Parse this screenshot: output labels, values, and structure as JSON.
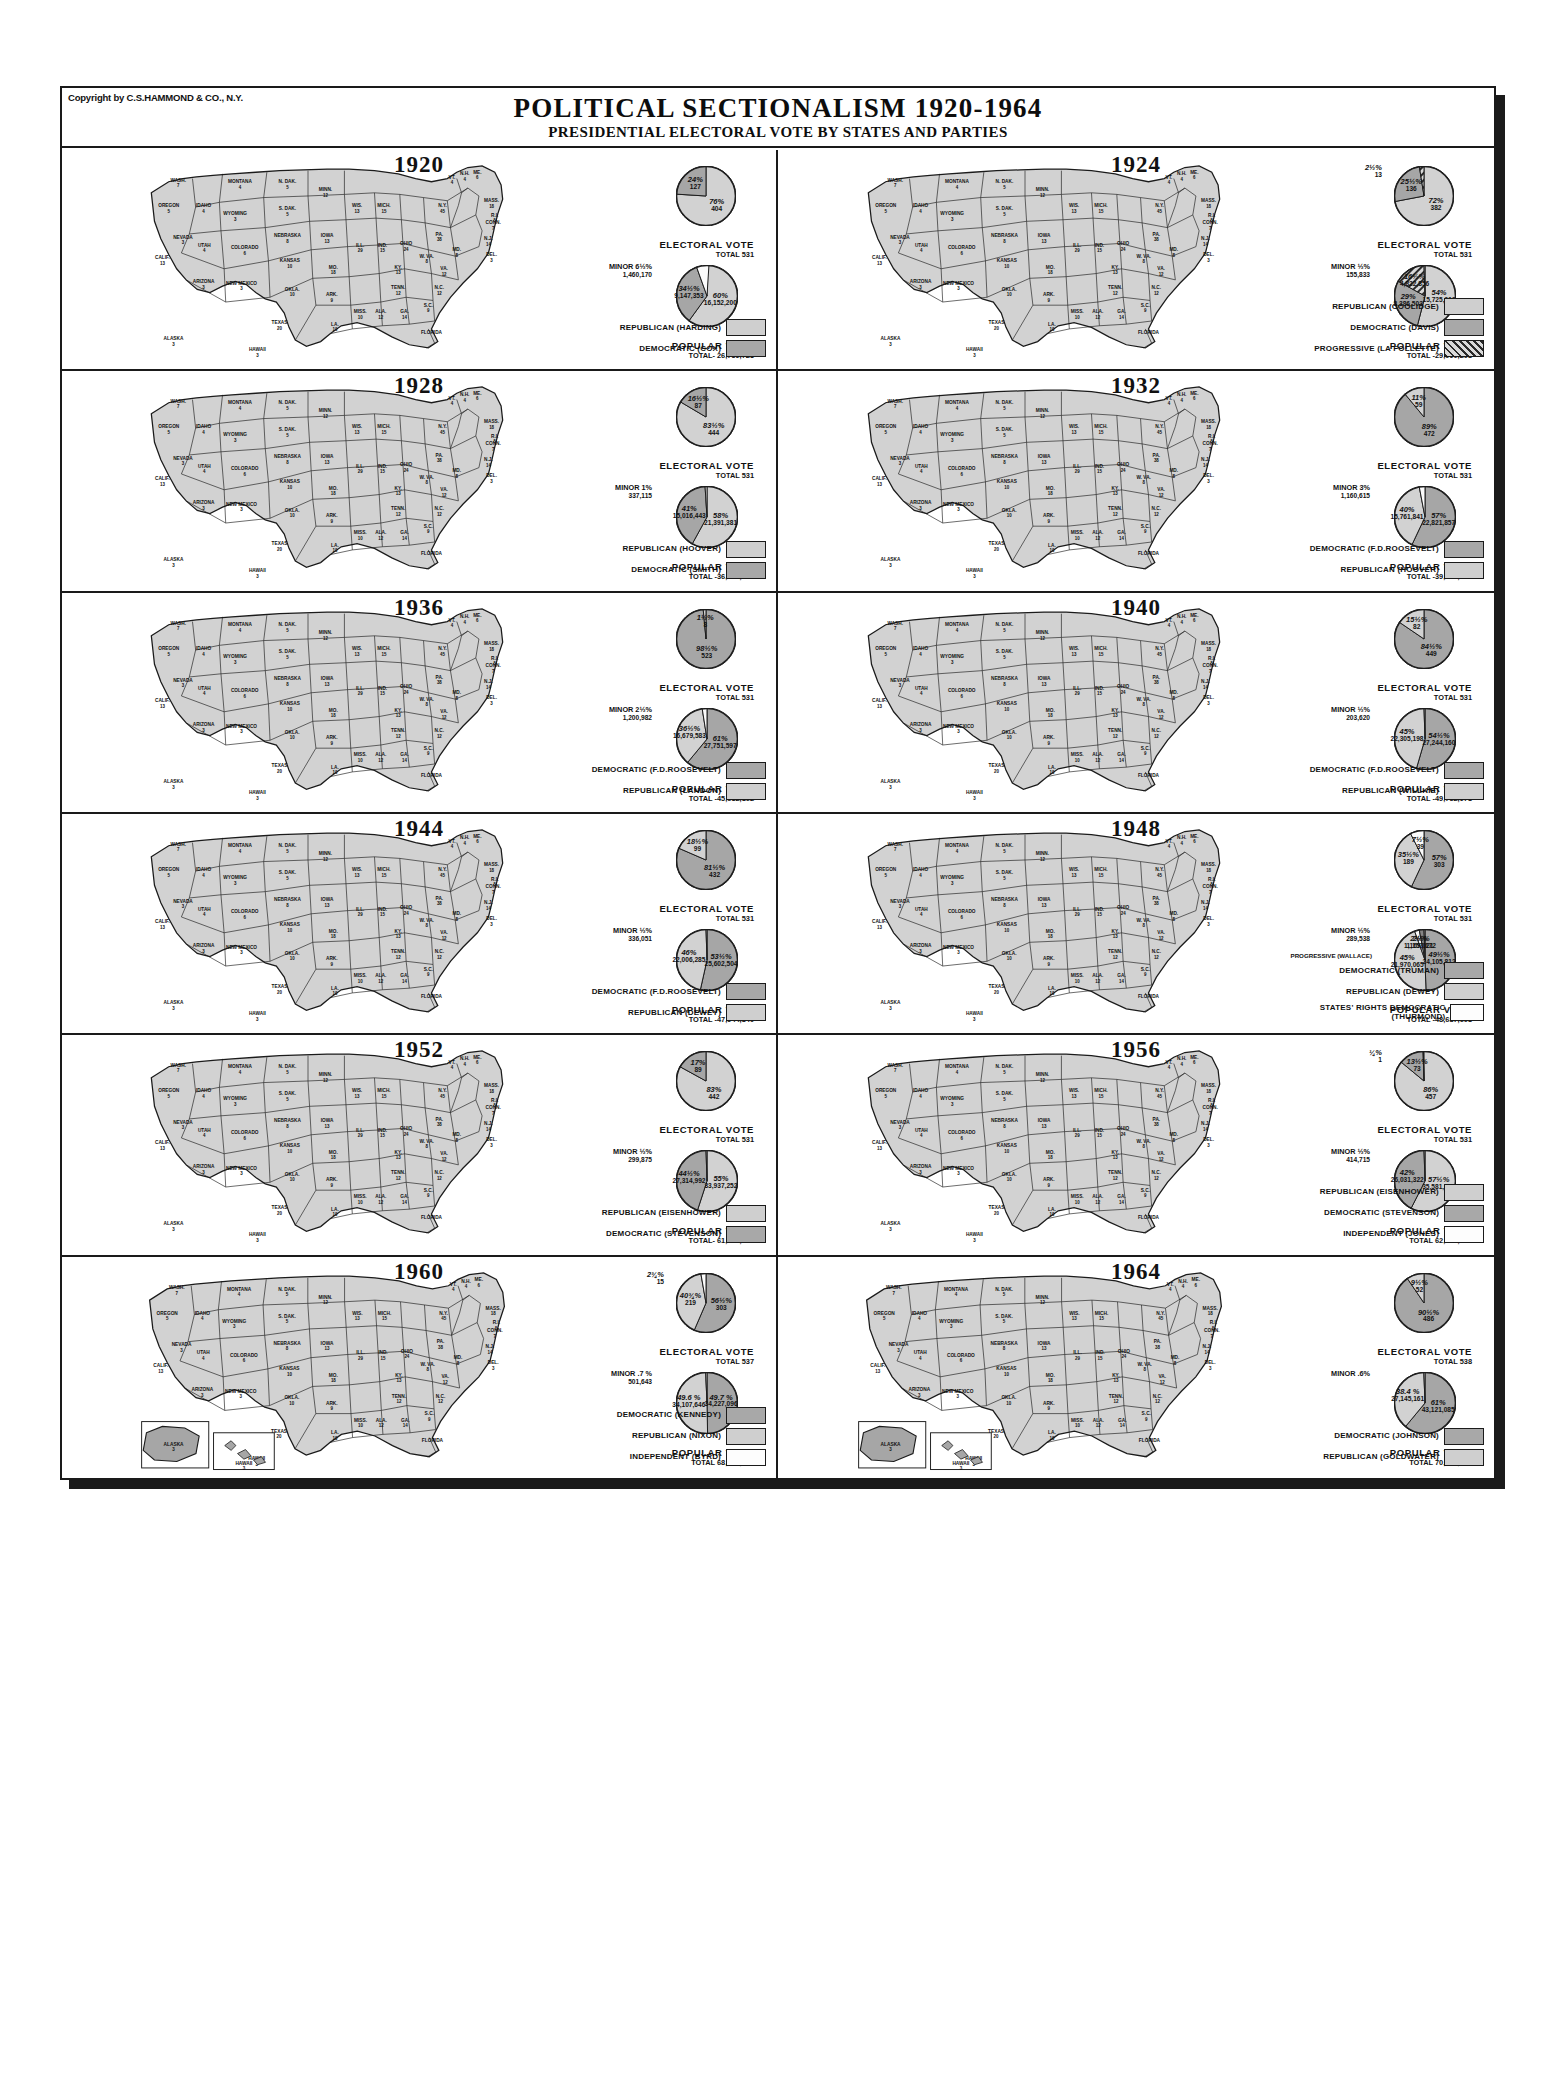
{
  "copyright": "Copyright by C.S.HAMMOND & CO., N.Y.",
  "header": {
    "title": "POLITICAL SECTIONALISM 1920-1964",
    "subtitle": "PRESIDENTIAL ELECTORAL VOTE BY STATES AND PARTIES"
  },
  "labels": {
    "electoral_title": "ELECTORAL VOTE",
    "popular_title": "POPULAR VOTE",
    "minor": "MINOR"
  },
  "chart_data": {
    "type": "pie",
    "title": "POLITICAL SECTIONALISM 1920-1964",
    "subtitle": "PRESIDENTIAL ELECTORAL VOTE BY STATES AND PARTIES",
    "panels": [
      {
        "year": "1920",
        "electoral_total": "TOTAL 531",
        "popular_total": "TOTAL- 26,759,723",
        "electoral": [
          {
            "pct": "76%",
            "value": "404",
            "share": 76,
            "fill": "light"
          },
          {
            "pct": "24%",
            "value": "127",
            "share": 24,
            "fill": "mid"
          }
        ],
        "popular": [
          {
            "pct": "60%",
            "value": "16,152,200",
            "share": 60,
            "fill": "light"
          },
          {
            "pct": "34½%",
            "value": "9,147,353",
            "share": 34.5,
            "fill": "mid"
          },
          {
            "pct": "6½%",
            "value": "1,460,170",
            "share": 6.5,
            "fill": "white",
            "minor": true
          }
        ],
        "legend": [
          {
            "label": "REPUBLICAN  (HARDING)",
            "fill": "light"
          },
          {
            "label": "DEMOCRATIC  (COX)",
            "fill": "mid"
          }
        ]
      },
      {
        "year": "1924",
        "electoral_total": "TOTAL 531",
        "popular_total": "TOTAL -29,090,208",
        "electoral": [
          {
            "pct": "72%",
            "value": "382",
            "share": 72,
            "fill": "light"
          },
          {
            "pct": "25½%",
            "value": "136",
            "share": 25.5,
            "fill": "mid"
          },
          {
            "pct": "2½%",
            "value": "13",
            "share": 2.5,
            "fill": "hatch",
            "minor": true
          }
        ],
        "popular": [
          {
            "pct": "54%",
            "value": "15,725,016",
            "share": 54,
            "fill": "light"
          },
          {
            "pct": "29%",
            "value": "8,386,503",
            "share": 29,
            "fill": "mid"
          },
          {
            "pct": "16½%",
            "value": "4,822,856",
            "share": 16.5,
            "fill": "hatch"
          },
          {
            "pct": "½%",
            "value": "155,833",
            "share": 0.5,
            "fill": "white",
            "minor": true
          }
        ],
        "legend": [
          {
            "label": "REPUBLICAN  (COOLIDGE)",
            "fill": "light"
          },
          {
            "label": "DEMOCRATIC  (DAVIS)",
            "fill": "mid"
          },
          {
            "label": "PROGRESSIVE  (LA FOLLETTE)",
            "fill": "hatch"
          }
        ]
      },
      {
        "year": "1928",
        "electoral_total": "TOTAL 531",
        "popular_total": "TOTAL -36,744,939",
        "electoral": [
          {
            "pct": "83½%",
            "value": "444",
            "share": 83.5,
            "fill": "light"
          },
          {
            "pct": "16½%",
            "value": "87",
            "share": 16.5,
            "fill": "mid"
          }
        ],
        "popular": [
          {
            "pct": "58%",
            "value": "21,391,381",
            "share": 58,
            "fill": "light"
          },
          {
            "pct": "41%",
            "value": "15,016,443",
            "share": 41,
            "fill": "mid"
          },
          {
            "pct": "1%",
            "value": "337,115",
            "share": 1,
            "fill": "white",
            "minor": true
          }
        ],
        "legend": [
          {
            "label": "REPUBLICAN  (HOOVER)",
            "fill": "light"
          },
          {
            "label": "DEMOCRATIC  (SMITH)",
            "fill": "mid"
          }
        ]
      },
      {
        "year": "1932",
        "electoral_total": "TOTAL 531",
        "popular_total": "TOTAL -39,744,313",
        "electoral": [
          {
            "pct": "89%",
            "value": "472",
            "share": 89,
            "fill": "mid"
          },
          {
            "pct": "11%",
            "value": "59",
            "share": 11,
            "fill": "light"
          }
        ],
        "popular": [
          {
            "pct": "57%",
            "value": "22,821,857",
            "share": 57,
            "fill": "mid"
          },
          {
            "pct": "40%",
            "value": "15,761,841",
            "share": 40,
            "fill": "light"
          },
          {
            "pct": "3%",
            "value": "1,160,615",
            "share": 3,
            "fill": "white",
            "minor": true
          }
        ],
        "legend": [
          {
            "label": "DEMOCRATIC  (F.D.ROOSEVELT)",
            "fill": "mid"
          },
          {
            "label": "REPUBLICAN  (HOOVER)",
            "fill": "light"
          }
        ]
      },
      {
        "year": "1936",
        "electoral_total": "TOTAL 531",
        "popular_total": "TOTAL -45,632,162",
        "electoral": [
          {
            "pct": "98½%",
            "value": "523",
            "share": 98.5,
            "fill": "mid"
          },
          {
            "pct": "1½%",
            "value": "8",
            "share": 1.5,
            "fill": "light"
          }
        ],
        "popular": [
          {
            "pct": "61%",
            "value": "27,751,597",
            "share": 61,
            "fill": "mid"
          },
          {
            "pct": "36½%",
            "value": "16,679,583",
            "share": 36.5,
            "fill": "light"
          },
          {
            "pct": "2½%",
            "value": "1,200,982",
            "share": 2.5,
            "fill": "white",
            "minor": true
          }
        ],
        "legend": [
          {
            "label": "DEMOCRATIC  (F.D.ROOSEVELT)",
            "fill": "mid"
          },
          {
            "label": "REPUBLICAN  (LANDON)",
            "fill": "light"
          }
        ]
      },
      {
        "year": "1940",
        "electoral_total": "TOTAL 531",
        "popular_total": "TOTAL -49,752,978",
        "electoral": [
          {
            "pct": "84½%",
            "value": "449",
            "share": 84.5,
            "fill": "mid"
          },
          {
            "pct": "15½%",
            "value": "82",
            "share": 15.5,
            "fill": "light"
          }
        ],
        "popular": [
          {
            "pct": "54½%",
            "value": "27,244,160",
            "share": 54.5,
            "fill": "mid"
          },
          {
            "pct": "45%",
            "value": "22,305,198",
            "share": 45,
            "fill": "light"
          },
          {
            "pct": "½%",
            "value": "203,620",
            "share": 0.5,
            "fill": "white",
            "minor": true
          }
        ],
        "legend": [
          {
            "label": "DEMOCRATIC  (F.D.ROOSEVELT)",
            "fill": "mid"
          },
          {
            "label": "REPUBLICAN  (WILLKIE)",
            "fill": "light"
          }
        ]
      },
      {
        "year": "1944",
        "electoral_total": "TOTAL 531",
        "popular_total": "TOTAL -47,944,840",
        "electoral": [
          {
            "pct": "81½%",
            "value": "432",
            "share": 81.5,
            "fill": "mid"
          },
          {
            "pct": "18½%",
            "value": "99",
            "share": 18.5,
            "fill": "light"
          }
        ],
        "popular": [
          {
            "pct": "53½%",
            "value": "25,602,504",
            "share": 53.5,
            "fill": "mid"
          },
          {
            "pct": "46%",
            "value": "22,006,285",
            "share": 46,
            "fill": "light"
          },
          {
            "pct": "½%",
            "value": "336,051",
            "share": 0.5,
            "fill": "white",
            "minor": true
          }
        ],
        "legend": [
          {
            "label": "DEMOCRATIC  (F.D.ROOSEVELT)",
            "fill": "mid"
          },
          {
            "label": "REPUBLICAN  (DEWEY)",
            "fill": "light"
          }
        ]
      },
      {
        "year": "1948",
        "electoral_total": "TOTAL 531",
        "popular_total": "TOTAL -48,687,608",
        "electoral": [
          {
            "pct": "57%",
            "value": "303",
            "share": 57,
            "fill": "mid"
          },
          {
            "pct": "35½%",
            "value": "189",
            "share": 35.5,
            "fill": "light"
          },
          {
            "pct": "7½%",
            "value": "39",
            "share": 7.5,
            "fill": "white"
          }
        ],
        "popular": [
          {
            "pct": "49½%",
            "value": "24,105,812",
            "share": 49.5,
            "fill": "mid"
          },
          {
            "pct": "45%",
            "value": "21,970,065",
            "share": 45,
            "fill": "light"
          },
          {
            "pct": "2½%",
            "value": "1,169,021",
            "share": 2.5,
            "fill": "white"
          },
          {
            "pct": "2½%",
            "value": "1,157,172",
            "share": 2.5,
            "fill": "dark"
          },
          {
            "pct": "½%",
            "value": "289,538",
            "share": 0.5,
            "fill": "white",
            "minor": true
          }
        ],
        "progressive_note": "PROGRESSIVE (WALLACE)",
        "legend": [
          {
            "label": "DEMOCRATIC  (TRUMAN)",
            "fill": "mid"
          },
          {
            "label": "REPUBLICAN  (DEWEY)",
            "fill": "light"
          },
          {
            "label": "STATES' RIGHTS DEMOCRATIC (THURMOND)",
            "fill": "white"
          }
        ]
      },
      {
        "year": "1952",
        "electoral_total": "TOTAL 531",
        "popular_total": "TOTAL- 61,551,919",
        "electoral": [
          {
            "pct": "83%",
            "value": "442",
            "share": 83,
            "fill": "light"
          },
          {
            "pct": "17%",
            "value": "89",
            "share": 17,
            "fill": "mid"
          }
        ],
        "popular": [
          {
            "pct": "55%",
            "value": "33,937,252",
            "share": 55,
            "fill": "light"
          },
          {
            "pct": "44½%",
            "value": "27,314,992",
            "share": 44.5,
            "fill": "mid"
          },
          {
            "pct": "½%",
            "value": "299,875",
            "share": 0.5,
            "fill": "white",
            "minor": true
          }
        ],
        "legend": [
          {
            "label": "REPUBLICAN  (EISENHOWER)",
            "fill": "light"
          },
          {
            "label": "DEMOCRATIC  (STEVENSON)",
            "fill": "mid"
          }
        ]
      },
      {
        "year": "1956",
        "electoral_total": "TOTAL 531",
        "popular_total": "TOTAL 62,027,040",
        "electoral": [
          {
            "pct": "86%",
            "value": "457",
            "share": 86,
            "fill": "light"
          },
          {
            "pct": "13½%",
            "value": "73",
            "share": 13.5,
            "fill": "mid"
          },
          {
            "pct": "¼%",
            "value": "1",
            "share": 0.25,
            "fill": "white",
            "minor": true
          }
        ],
        "popular": [
          {
            "pct": "57½%",
            "value": "35,581,003",
            "share": 57.5,
            "fill": "light"
          },
          {
            "pct": "42%",
            "value": "26,031,322",
            "share": 42,
            "fill": "mid"
          },
          {
            "pct": "½%",
            "value": "414,715",
            "share": 0.5,
            "fill": "white",
            "minor": true
          }
        ],
        "legend": [
          {
            "label": "REPUBLICAN  (EISENHOWER)",
            "fill": "light"
          },
          {
            "label": "DEMOCRATIC  (STEVENSON)",
            "fill": "mid"
          },
          {
            "label": "INDEPENDENT  (JONES)",
            "fill": "white"
          }
        ]
      },
      {
        "year": "1960",
        "electoral_total": "TOTAL 537",
        "popular_total": "TOTAL 68,836,385",
        "electoral": [
          {
            "pct": "56½%",
            "value": "303",
            "share": 56.5,
            "fill": "mid"
          },
          {
            "pct": "40¾%",
            "value": "219",
            "share": 40.75,
            "fill": "light"
          },
          {
            "pct": "2¾%",
            "value": "15",
            "share": 2.75,
            "fill": "white",
            "minor": true
          }
        ],
        "popular": [
          {
            "pct": "49.7 %",
            "value": "34,227,096",
            "share": 49.7,
            "fill": "mid"
          },
          {
            "pct": "49.6 %",
            "value": "34,107,646",
            "share": 49.6,
            "fill": "light"
          },
          {
            "pct": ".7 %",
            "value": "501,643",
            "share": 0.7,
            "fill": "white",
            "minor": true
          }
        ],
        "legend": [
          {
            "label": "DEMOCRATIC  (KENNEDY)",
            "fill": "mid"
          },
          {
            "label": "REPUBLICAN  (NIXON)",
            "fill": "light"
          },
          {
            "label": "INDEPENDENT  (BYRD)",
            "fill": "white"
          }
        ]
      },
      {
        "year": "1964",
        "electoral_total": "TOTAL 538",
        "popular_total": "TOTAL 70,640,289",
        "electoral": [
          {
            "pct": "90½%",
            "value": "486",
            "share": 90.5,
            "fill": "mid"
          },
          {
            "pct": "9½%",
            "value": "52",
            "share": 9.5,
            "fill": "light"
          }
        ],
        "popular": [
          {
            "pct": "61%",
            "value": "43,121,085",
            "share": 61,
            "fill": "mid"
          },
          {
            "pct": "38.4 %",
            "value": "27,145,161",
            "share": 38.4,
            "fill": "light"
          },
          {
            "pct": ".6%",
            "value": "",
            "share": 0.6,
            "fill": "white",
            "minor": true
          }
        ],
        "legend": [
          {
            "label": "DEMOCRATIC  (JOHNSON)",
            "fill": "mid"
          },
          {
            "label": "REPUBLICAN  (GOLDWATER)",
            "fill": "light"
          }
        ]
      }
    ]
  },
  "map_states": [
    {
      "name": "WASH.",
      "v": "7",
      "x": 52,
      "y": 30
    },
    {
      "name": "OREGON",
      "v": "5",
      "x": 40,
      "y": 62
    },
    {
      "name": "CALIF.",
      "v": "13",
      "x": 32,
      "y": 128
    },
    {
      "name": "NEVADA",
      "v": "3",
      "x": 58,
      "y": 102
    },
    {
      "name": "IDAHO",
      "v": "4",
      "x": 84,
      "y": 62
    },
    {
      "name": "MONTANA",
      "v": "4",
      "x": 130,
      "y": 32
    },
    {
      "name": "WYOMING",
      "v": "3",
      "x": 124,
      "y": 72
    },
    {
      "name": "UTAH",
      "v": "4",
      "x": 85,
      "y": 112
    },
    {
      "name": "ARIZONA",
      "v": "3",
      "x": 84,
      "y": 158
    },
    {
      "name": "COLORADO",
      "v": "6",
      "x": 136,
      "y": 115
    },
    {
      "name": "NEW MEXICO",
      "v": "3",
      "x": 132,
      "y": 160
    },
    {
      "name": "N. DAK.",
      "v": "5",
      "x": 190,
      "y": 32
    },
    {
      "name": "S. DAK.",
      "v": "5",
      "x": 190,
      "y": 66
    },
    {
      "name": "NEBRASKA",
      "v": "8",
      "x": 190,
      "y": 100
    },
    {
      "name": "KANSAS",
      "v": "10",
      "x": 193,
      "y": 132
    },
    {
      "name": "OKLA.",
      "v": "10",
      "x": 196,
      "y": 168
    },
    {
      "name": "TEXAS",
      "v": "20",
      "x": 180,
      "y": 210
    },
    {
      "name": "MINN.",
      "v": "12",
      "x": 238,
      "y": 42
    },
    {
      "name": "IOWA",
      "v": "13",
      "x": 240,
      "y": 100
    },
    {
      "name": "MO.",
      "v": "18",
      "x": 248,
      "y": 140
    },
    {
      "name": "ARK.",
      "v": "9",
      "x": 246,
      "y": 175
    },
    {
      "name": "LA.",
      "v": "10",
      "x": 250,
      "y": 212
    },
    {
      "name": "WIS.",
      "v": "13",
      "x": 278,
      "y": 62
    },
    {
      "name": "ILL.",
      "v": "29",
      "x": 282,
      "y": 112
    },
    {
      "name": "MISS.",
      "v": "10",
      "x": 282,
      "y": 196
    },
    {
      "name": "ALA.",
      "v": "12",
      "x": 308,
      "y": 196
    },
    {
      "name": "IND.",
      "v": "15",
      "x": 310,
      "y": 112
    },
    {
      "name": "MICH.",
      "v": "15",
      "x": 312,
      "y": 62
    },
    {
      "name": "OHIO",
      "v": "24",
      "x": 340,
      "y": 110
    },
    {
      "name": "KY.",
      "v": "13",
      "x": 330,
      "y": 140
    },
    {
      "name": "TENN.",
      "v": "12",
      "x": 330,
      "y": 166
    },
    {
      "name": "GA.",
      "v": "14",
      "x": 338,
      "y": 196
    },
    {
      "name": "FLORIDA",
      "v": "",
      "x": 372,
      "y": 222
    },
    {
      "name": "W. VA.",
      "v": "8",
      "x": 366,
      "y": 126
    },
    {
      "name": "VA.",
      "v": "12",
      "x": 388,
      "y": 142
    },
    {
      "name": "N.C.",
      "v": "12",
      "x": 382,
      "y": 166
    },
    {
      "name": "S.C.",
      "v": "9",
      "x": 368,
      "y": 188
    },
    {
      "name": "PA.",
      "v": "38",
      "x": 382,
      "y": 98
    },
    {
      "name": "N.Y.",
      "v": "45",
      "x": 386,
      "y": 62
    },
    {
      "name": "ME.",
      "v": "6",
      "x": 430,
      "y": 20
    },
    {
      "name": "VT.",
      "v": "4",
      "x": 398,
      "y": 26
    },
    {
      "name": "N.H.",
      "v": "4",
      "x": 414,
      "y": 22
    },
    {
      "name": "MASS.",
      "v": "18",
      "x": 448,
      "y": 56
    },
    {
      "name": "R.I.",
      "v": "5",
      "x": 452,
      "y": 74
    },
    {
      "name": "CONN.",
      "v": "7",
      "x": 450,
      "y": 84
    },
    {
      "name": "N.J.",
      "v": "14",
      "x": 444,
      "y": 104
    },
    {
      "name": "DEL.",
      "v": "3",
      "x": 448,
      "y": 124
    },
    {
      "name": "MD.",
      "v": "8",
      "x": 404,
      "y": 118
    },
    {
      "name": "ALASKA",
      "v": "3",
      "x": 46,
      "y": 230
    },
    {
      "name": "HAWAII",
      "v": "3",
      "x": 152,
      "y": 244
    }
  ]
}
